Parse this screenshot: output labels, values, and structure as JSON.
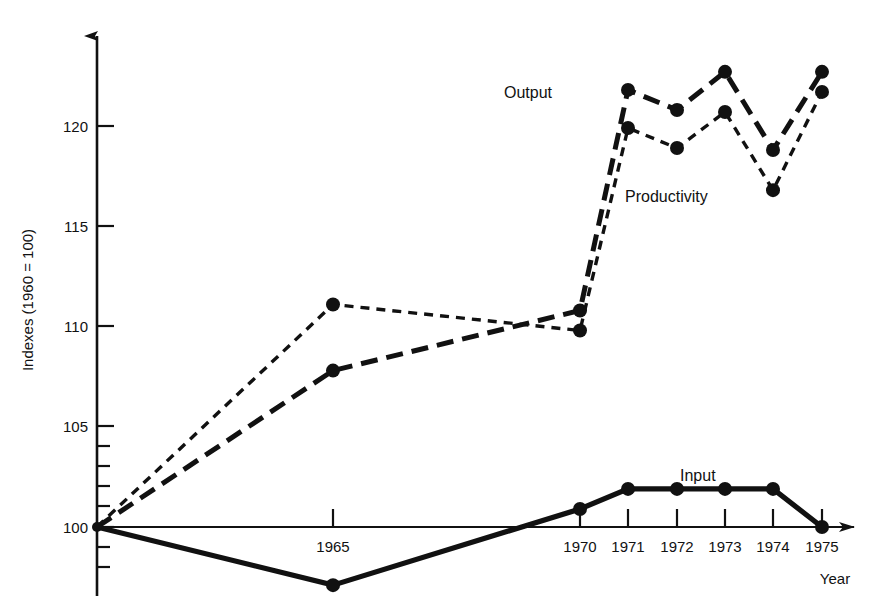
{
  "chart_data": {
    "type": "line",
    "title": "",
    "xlabel": "Year",
    "ylabel": "Indexes (1960 = 100)",
    "x": [
      1960,
      1965,
      1970,
      1971,
      1972,
      1973,
      1974,
      1975
    ],
    "x_tick_labels": [
      "1965",
      "1970",
      "1971",
      "1972",
      "1973",
      "1974",
      "1975"
    ],
    "x_tick_values": [
      1965,
      1970,
      1971,
      1972,
      1973,
      1974,
      1975
    ],
    "y_tick_labels": [
      "100",
      "105",
      "110",
      "115",
      "120"
    ],
    "y_tick_values": [
      100,
      105,
      110,
      115,
      120
    ],
    "ylim": [
      96.5,
      124.5
    ],
    "xlim": [
      1960,
      1976
    ],
    "grid": false,
    "legend_position": "inline-annotations",
    "series": [
      {
        "name": "Output",
        "style": "long-dash",
        "values": [
          100.0,
          107.8,
          110.8,
          121.8,
          120.8,
          122.7,
          118.8,
          122.7
        ]
      },
      {
        "name": "Productivity",
        "style": "short-dash",
        "values": [
          100.0,
          111.1,
          109.8,
          119.9,
          118.9,
          120.7,
          116.8,
          121.7
        ]
      },
      {
        "name": "Input",
        "style": "solid",
        "values": [
          100.0,
          97.1,
          100.9,
          101.9,
          101.9,
          101.9,
          101.9,
          100.0
        ]
      }
    ],
    "annotations": [
      {
        "text": "Output",
        "series": "Output"
      },
      {
        "text": "Productivity",
        "series": "Productivity"
      },
      {
        "text": "Input",
        "series": "Input"
      }
    ]
  },
  "axes": {
    "y_axis_label": "Indexes (1960 = 100)",
    "x_axis_label": "Year",
    "y_ticks": [
      "120",
      "115",
      "110",
      "105",
      "100"
    ],
    "x_ticks": [
      "1965",
      "1970",
      "1971",
      "1972",
      "1973",
      "1974",
      "1975"
    ]
  },
  "labels": {
    "output": "Output",
    "productivity": "Productivity",
    "input": "Input"
  },
  "colors": {
    "ink": "#111111",
    "background": "#ffffff"
  }
}
